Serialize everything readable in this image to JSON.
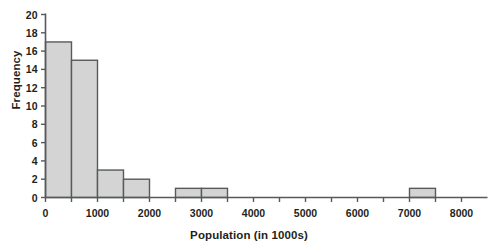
{
  "chart_data": {
    "type": "bar",
    "title": "",
    "subtitle": "",
    "xlabel": "Population (in 1000s)",
    "ylabel": "Frequency",
    "xlim": [
      0,
      8500
    ],
    "ylim": [
      0,
      20
    ],
    "grid": false,
    "legend": null,
    "bin_width": 500,
    "categories": [
      "0-500",
      "500-1000",
      "1000-1500",
      "1500-2000",
      "2000-2500",
      "2500-3000",
      "3000-3500",
      "3500-4000",
      "4000-4500",
      "4500-5000",
      "5000-5500",
      "5500-6000",
      "6000-6500",
      "6500-7000",
      "7000-7500",
      "7500-8000",
      "8000-8500"
    ],
    "bins": [
      {
        "start": 0,
        "end": 500,
        "value": 17
      },
      {
        "start": 500,
        "end": 1000,
        "value": 15
      },
      {
        "start": 1000,
        "end": 1500,
        "value": 3
      },
      {
        "start": 1500,
        "end": 2000,
        "value": 2
      },
      {
        "start": 2000,
        "end": 2500,
        "value": 0
      },
      {
        "start": 2500,
        "end": 3000,
        "value": 1
      },
      {
        "start": 3000,
        "end": 3500,
        "value": 1
      },
      {
        "start": 3500,
        "end": 4000,
        "value": 0
      },
      {
        "start": 4000,
        "end": 4500,
        "value": 0
      },
      {
        "start": 4500,
        "end": 5000,
        "value": 0
      },
      {
        "start": 5000,
        "end": 5500,
        "value": 0
      },
      {
        "start": 5500,
        "end": 6000,
        "value": 0
      },
      {
        "start": 6000,
        "end": 6500,
        "value": 0
      },
      {
        "start": 6500,
        "end": 7000,
        "value": 0
      },
      {
        "start": 7000,
        "end": 7500,
        "value": 1
      },
      {
        "start": 7500,
        "end": 8000,
        "value": 0
      },
      {
        "start": 8000,
        "end": 8500,
        "value": 0
      }
    ],
    "values": [
      17,
      15,
      3,
      2,
      0,
      1,
      1,
      0,
      0,
      0,
      0,
      0,
      0,
      0,
      1,
      0,
      0
    ],
    "yticks": [
      0,
      2,
      4,
      6,
      8,
      10,
      12,
      14,
      16,
      18,
      20
    ],
    "ytick_labels": [
      "0",
      "2",
      "4",
      "6",
      "8",
      "10",
      "12",
      "14",
      "16",
      "18",
      "20"
    ],
    "xticks_major": [
      0,
      1000,
      2000,
      3000,
      4000,
      5000,
      6000,
      7000,
      8000
    ],
    "xtick_labels": [
      "0",
      "1000",
      "2000",
      "3000",
      "4000",
      "5000",
      "6000",
      "7000",
      "8000"
    ],
    "xticks_minor": [
      500,
      1500,
      2500,
      3500,
      4500,
      5500,
      6500,
      7500
    ],
    "colors": {
      "bar_fill": "#d4d4d4",
      "bar_stroke": "#58595b",
      "axis": "#58595b",
      "text": "#231f20",
      "background": "#ffffff"
    }
  }
}
